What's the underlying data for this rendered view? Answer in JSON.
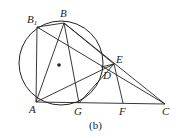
{
  "diagram": {
    "caption": "(b)",
    "circle": {
      "cx": 61,
      "cy": 63,
      "r": 42
    },
    "center_dot": {
      "x": 59,
      "y": 65
    },
    "points": {
      "B1": {
        "label": "B",
        "sub": "1",
        "x": 37,
        "y": 27
      },
      "B": {
        "label": "B",
        "x": 64,
        "y": 23
      },
      "A": {
        "label": "A",
        "x": 36,
        "y": 102
      },
      "G": {
        "label": "G",
        "x": 79,
        "y": 103
      },
      "D": {
        "label": "D",
        "x": 101,
        "y": 67
      },
      "E": {
        "label": "E",
        "x": 114,
        "y": 64
      },
      "F": {
        "label": "F",
        "x": 123,
        "y": 103
      },
      "C": {
        "label": "C",
        "x": 165,
        "y": 104
      }
    },
    "segments": [
      [
        "B1",
        "B"
      ],
      [
        "B1",
        "A"
      ],
      [
        "B1",
        "C"
      ],
      [
        "B1",
        "E"
      ],
      [
        "B",
        "A"
      ],
      [
        "B",
        "G"
      ],
      [
        "B",
        "C"
      ],
      [
        "B",
        "D"
      ],
      [
        "A",
        "C"
      ],
      [
        "A",
        "E"
      ],
      [
        "G",
        "E"
      ],
      [
        "E",
        "F"
      ],
      [
        "D",
        "E"
      ]
    ],
    "line_color": "#222222"
  }
}
